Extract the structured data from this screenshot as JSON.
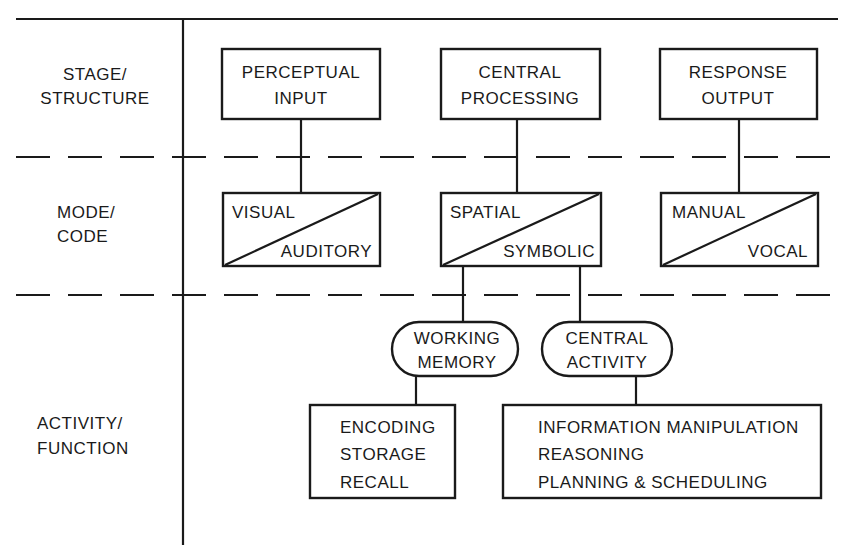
{
  "rows": [
    {
      "label_line1": "STAGE/",
      "label_line2": "STRUCTURE"
    },
    {
      "label_line1": "MODE/",
      "label_line2": "CODE"
    },
    {
      "label_line1": "ACTIVITY/",
      "label_line2": "FUNCTION"
    }
  ],
  "stages": [
    {
      "line1": "PERCEPTUAL",
      "line2": "INPUT"
    },
    {
      "line1": "CENTRAL",
      "line2": "PROCESSING"
    },
    {
      "line1": "RESPONSE",
      "line2": "OUTPUT"
    }
  ],
  "modes": [
    {
      "upper": "VISUAL",
      "lower": "AUDITORY"
    },
    {
      "upper": "SPATIAL",
      "lower": "SYMBOLIC"
    },
    {
      "upper": "MANUAL",
      "lower": "VOCAL"
    }
  ],
  "resources": [
    {
      "line1": "WORKING",
      "line2": "MEMORY"
    },
    {
      "line1": "CENTRAL",
      "line2": "ACTIVITY"
    }
  ],
  "functions": {
    "memory": [
      "ENCODING",
      "STORAGE",
      "RECALL"
    ],
    "central": [
      "INFORMATION MANIPULATION",
      "REASONING",
      "PLANNING & SCHEDULING"
    ]
  }
}
